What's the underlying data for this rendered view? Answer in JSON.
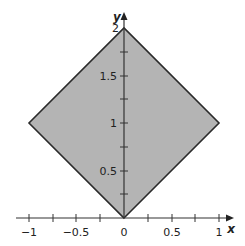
{
  "diagram": {
    "type": "region-plot",
    "shape": "square rotated 45° (diamond)",
    "vertices": [
      [
        0,
        0
      ],
      [
        1,
        1
      ],
      [
        0,
        2
      ],
      [
        -1,
        1
      ]
    ],
    "fill_color": "#b4b4b4",
    "stroke_color": "#2a2a2a",
    "axes": {
      "x": {
        "name": "x",
        "range": [
          -1.05,
          1.05
        ],
        "ticks": [
          -1,
          -0.75,
          -0.5,
          -0.25,
          0,
          0.25,
          0.5,
          0.75,
          1
        ],
        "labels": [
          "−1",
          "−0.5",
          "0",
          "0.5",
          "1"
        ]
      },
      "y": {
        "name": "y",
        "range": [
          0,
          2.05
        ],
        "ticks": [
          0.25,
          0.5,
          0.75,
          1,
          1.25,
          1.5,
          1.75,
          2
        ],
        "labels": [
          "0.5",
          "1",
          "1.5",
          "2"
        ]
      }
    }
  }
}
